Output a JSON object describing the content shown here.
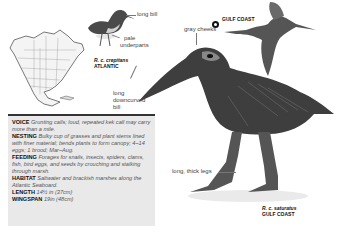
{
  "figures": {
    "map": {
      "icon": "north-america-range-map"
    },
    "small_bird": {
      "subspecies": "R. c. crepitans",
      "region": "ATLANTIC",
      "labels": [
        "long bill",
        "pale underparts"
      ]
    },
    "flying_bird": {
      "region_icon": "region-marker-icon",
      "region": "GULF COAST"
    },
    "large_bird": {
      "subspecies": "R. c. saturatus",
      "region": "GULF COAST",
      "labels": [
        "gray cheeks",
        "long downcurved bill",
        "long, thick legs"
      ]
    }
  },
  "labels": {
    "long_bill": "long bill",
    "pale_underparts_1": "pale",
    "pale_underparts_2": "underparts",
    "gray_cheeks": "gray cheeks",
    "downcurved_1": "long",
    "downcurved_2": "downcurved",
    "downcurved_3": "bill",
    "thick_legs": "long, thick legs",
    "atlantic_sub": "R. c. crepitans",
    "atlantic_region": "ATLANTIC",
    "gulf_region_top": "GULF COAST",
    "gulf_sub": "R. c. saturatus",
    "gulf_region_bottom": "GULF COAST"
  },
  "facts": [
    {
      "key": "VOICE",
      "value": "Grunting calls; loud, repeated kek call may carry more than a mile."
    },
    {
      "key": "NESTING",
      "value": "Bulky cup of grasses and plant stems lined with finer material; bends plants to form canopy; 4–14 eggs; 1 brood; Mar–Aug."
    },
    {
      "key": "FEEDING",
      "value": "Forages for snails, insects, spiders, clams, fish, bird eggs, and seeds by crouching and stalking through marsh."
    },
    {
      "key": "HABITAT",
      "value": "Saltwater and brackish marshes along the Atlantic Seaboard."
    },
    {
      "key": "LENGTH",
      "value": "14½ in (37cm)"
    },
    {
      "key": "WINGSPAN",
      "value": "19in (48cm)"
    }
  ],
  "colors": {
    "panel_bg": "#e9e9e9",
    "panel_border": "#333333",
    "bird_dark": "#3a3a3a",
    "bird_mid": "#6e6e6e"
  }
}
